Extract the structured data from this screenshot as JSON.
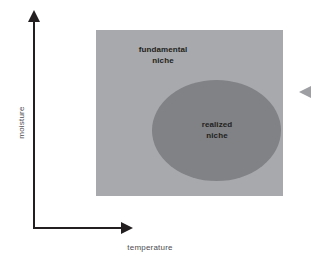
{
  "figure": {
    "background_color": "#ffffff"
  },
  "axes": {
    "x_label": "temperature",
    "y_label": "moisture",
    "axis_color": "#231f20",
    "label_color": "#4d4d4f",
    "x_arrow_direction": "right",
    "y_arrow_direction": "up"
  },
  "shapes": {
    "fundamental": {
      "label_line1": "fundamental",
      "label_line2": "niche",
      "color": "#a7a9ac",
      "shape": "rectangle"
    },
    "realized": {
      "label_line1": "realized",
      "label_line2": "niche",
      "color": "#808285",
      "shape": "ellipse"
    }
  },
  "markers": {
    "edge_pointer": {
      "name": "left-pointing-triangle",
      "color": "#9d9fa2"
    }
  },
  "chart_data": {
    "type": "diagram",
    "title": "",
    "xlabel": "temperature",
    "ylabel": "moisture",
    "grid": false,
    "legend": "none",
    "regions": [
      {
        "name": "fundamental niche",
        "shape": "rectangle",
        "color": "#a7a9ac",
        "x_range": [
          96,
          283
        ],
        "y_range": [
          30,
          196
        ]
      },
      {
        "name": "realized niche",
        "shape": "ellipse",
        "color": "#808285",
        "center": [
          216.5,
          130.5
        ],
        "radii": [
          64.5,
          50.5
        ]
      }
    ]
  }
}
